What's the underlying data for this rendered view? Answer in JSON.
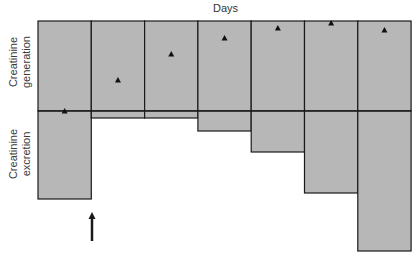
{
  "chart_data": {
    "type": "bar",
    "title": "Days",
    "xlabel": "Days",
    "ylabel_top": "Creatinine generation",
    "ylabel_bottom": "Creatinine excretion",
    "categories": [
      "Day 1",
      "Day 2",
      "Day 3",
      "Day 4",
      "Day 5",
      "Day 6",
      "Day 7"
    ],
    "series": [
      {
        "name": "Creatinine generation",
        "kind": "box_above_baseline",
        "values": [
          90,
          90,
          90,
          90,
          90,
          90,
          90
        ]
      },
      {
        "name": "Creatinine excretion",
        "kind": "box_below_baseline",
        "values": [
          88,
          7,
          7,
          20,
          41,
          82,
          140
        ]
      },
      {
        "name": "Estimated generation (triangle markers)",
        "kind": "marker",
        "values": [
          0,
          31,
          57,
          73,
          83,
          88,
          81
        ]
      }
    ],
    "units": "relative (pixels from baseline)",
    "grid": false,
    "legend": "none",
    "annotation": {
      "type": "arrow",
      "pointing": "up",
      "position": "below boundary between Day 1 and Day 2"
    }
  },
  "labels": {
    "title": "Days",
    "gen_line1": "Creatinine",
    "gen_line2": "generation",
    "exc_line1": "Creatinine",
    "exc_line2": "excretion"
  },
  "colors": {
    "fill": "#b7b7b7",
    "stroke": "#1a1a1a",
    "marker": "#111111",
    "background": "#ffffff"
  },
  "layout": {
    "left": 38,
    "col_width": 53.3,
    "top": 21,
    "baseline": 111,
    "arrow": {
      "x": 92,
      "y_tip": 212,
      "y_tail": 241
    }
  }
}
